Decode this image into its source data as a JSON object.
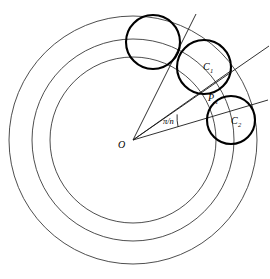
{
  "figure": {
    "background_color": "#ffffff",
    "thin_line_color": "#3a3a3a",
    "bold_line_color": "#000000",
    "ray_line_color": "#1a1a1a"
  },
  "center": {
    "label": "O",
    "x": 133,
    "y": 140
  },
  "concentric_circles": [
    {
      "name": "outer-circle",
      "cx": 133,
      "cy": 140,
      "r": 124
    },
    {
      "name": "middle-circle",
      "cx": 133,
      "cy": 140,
      "r": 101
    },
    {
      "name": "inner-circle",
      "cx": 133,
      "cy": 140,
      "r": 83
    }
  ],
  "tangent_circles": [
    {
      "name": "circle-0",
      "cx": 153,
      "cy": 42,
      "r": 27,
      "label": "",
      "sub": ""
    },
    {
      "name": "circle-1",
      "cx": 204,
      "cy": 67,
      "r": 27,
      "label": "C",
      "sub": "1"
    },
    {
      "name": "circle-2",
      "cx": 231,
      "cy": 120,
      "r": 24,
      "label": "C",
      "sub": "2"
    }
  ],
  "labels": {
    "center": "O",
    "c1": "C",
    "c1_sub": "1",
    "c2": "C",
    "c2_sub": "2",
    "p1": "P",
    "p1_sub": "1",
    "angle": "π/n"
  },
  "points": {
    "p1": {
      "name": "tangency-point",
      "x": 213,
      "y": 98,
      "label": "P",
      "sub": "1"
    }
  },
  "rays": [
    {
      "name": "ray-to-circle-1-center",
      "x1": 133,
      "y1": 140,
      "x2": 269,
      "y2": 46
    },
    {
      "name": "ray-to-circle-2-center",
      "x1": 133,
      "y1": 140,
      "x2": 268,
      "y2": 100
    },
    {
      "name": "ray-upper-boundary",
      "x1": 133,
      "y1": 140,
      "x2": 196,
      "y2": 14
    },
    {
      "name": "ray-through-tangency",
      "x1": 133,
      "y1": 140,
      "x2": 226,
      "y2": 74
    }
  ],
  "angle_arc": {
    "name": "angle-pi-over-n",
    "label": "π/n",
    "vertex_x": 133,
    "vertex_y": 140,
    "radius": 46,
    "start_deg": -34.6,
    "end_deg": -16.5
  }
}
